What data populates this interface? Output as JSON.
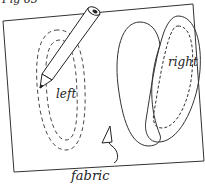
{
  "figure": {
    "label": "Fig 65",
    "labels": {
      "left": "left",
      "right": "right",
      "fabric": "fabric"
    },
    "colors": {
      "ink": "#222222",
      "paper": "#ffffff"
    }
  }
}
